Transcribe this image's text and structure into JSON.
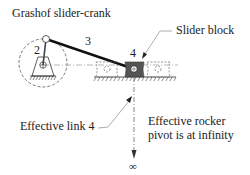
{
  "title": "Grashof slider-crank",
  "labels": {
    "link2": "2",
    "link3": "3",
    "link4": "4",
    "slider_block": "Slider block",
    "effective_link4": "Effective link 4",
    "rocker_line1": "Effective rocker",
    "rocker_line2": "pivot is at infinity",
    "infinity": "∞"
  },
  "colors": {
    "line": "#222222",
    "slider_fill": "#555555",
    "dashed": "#555555"
  }
}
